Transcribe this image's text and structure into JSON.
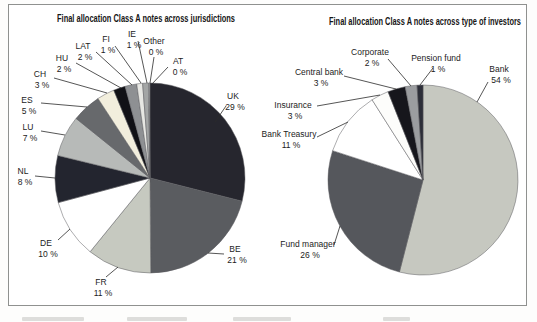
{
  "figure": {
    "background": "#ffffff",
    "border_color": "#8f918f",
    "text_color": "#1c1c1c",
    "leader_line_color": "#2b2b2b"
  },
  "chart_data": [
    {
      "type": "pie",
      "title": "Final allocation Class A notes across jurisdictions",
      "legend": "none",
      "label_style": "outside-leader-lines",
      "labels": [
        "UK",
        "BE",
        "FR",
        "DE",
        "NL",
        "LU",
        "ES",
        "CH",
        "HU",
        "LAT",
        "FI",
        "IE",
        "Other",
        "AT"
      ],
      "values": [
        29,
        21,
        11,
        10,
        8,
        7,
        5,
        3,
        2,
        2,
        1,
        1,
        0,
        0
      ],
      "value_labels": [
        "29 %",
        "21 %",
        "11 %",
        "10 %",
        "8 %",
        "7 %",
        "5 %",
        "3 %",
        "2 %",
        "2 %",
        "1 %",
        "1 %",
        "0 %",
        "0 %"
      ],
      "colors": [
        "#26262e",
        "#5a5c60",
        "#c6c9c0",
        "#ffffff",
        "#23252f",
        "#b7bab8",
        "#67696c",
        "#f2eedd",
        "#111116",
        "#8e9093",
        "#e7e7e3",
        "#a3a5a5",
        "#fafafa",
        "#cfcfcf"
      ]
    },
    {
      "type": "pie",
      "title": "Final allocation Class A notes across type of investors",
      "legend": "none",
      "label_style": "outside-leader-lines",
      "labels": [
        "Bank",
        "Fund manager",
        "Bank Treasury",
        "Insurance",
        "Central bank",
        "Corporate",
        "Pension fund"
      ],
      "values": [
        54,
        26,
        11,
        3,
        3,
        2,
        1
      ],
      "value_labels": [
        "54 %",
        "26 %",
        "11 %",
        "3 %",
        "3 %",
        "2 %",
        "1 %"
      ],
      "colors": [
        "#c6c8c0",
        "#55575c",
        "#ffffff",
        "#fdfdfb",
        "#16161c",
        "#9b9da0",
        "#2c2e38"
      ]
    }
  ]
}
